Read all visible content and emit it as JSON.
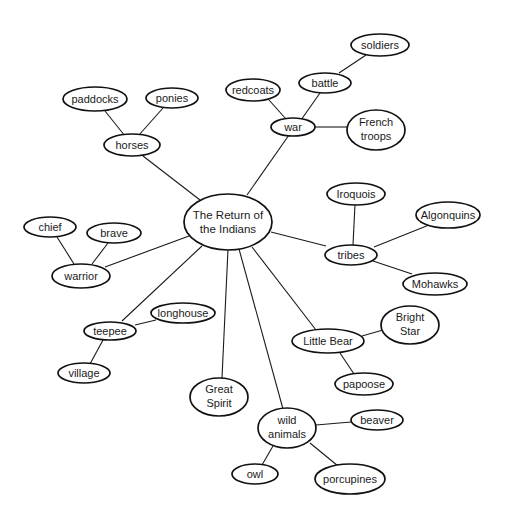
{
  "diagram": {
    "type": "concept-map",
    "center": {
      "line1": "The Return of",
      "line2": "the Indians"
    },
    "nodes": {
      "horses": "horses",
      "paddocks": "paddocks",
      "ponies": "ponies",
      "war": "war",
      "redcoats": "redcoats",
      "battle": "battle",
      "soldiers": "soldiers",
      "french_troops": {
        "line1": "French",
        "line2": "troops"
      },
      "warrior": "warrior",
      "chief": "chief",
      "brave": "brave",
      "teepee": "teepee",
      "longhouse": "longhouse",
      "village": "village",
      "great_spirit": {
        "line1": "Great",
        "line2": "Spirit"
      },
      "tribes": "tribes",
      "iroquois": "Iroquois",
      "algonquins": "Algonquins",
      "mohawks": "Mohawks",
      "little_bear": "Little Bear",
      "bright_star": {
        "line1": "Bright",
        "line2": "Star"
      },
      "papoose": "papoose",
      "wild_animals": {
        "line1": "wild",
        "line2": "animals"
      },
      "beaver": "beaver",
      "owl": "owl",
      "porcupines": "porcupines"
    },
    "edges": [
      [
        "The Return of the Indians",
        "horses"
      ],
      [
        "horses",
        "paddocks"
      ],
      [
        "horses",
        "ponies"
      ],
      [
        "The Return of the Indians",
        "war"
      ],
      [
        "war",
        "redcoats"
      ],
      [
        "war",
        "battle"
      ],
      [
        "battle",
        "soldiers"
      ],
      [
        "war",
        "French troops"
      ],
      [
        "The Return of the Indians",
        "warrior"
      ],
      [
        "warrior",
        "chief"
      ],
      [
        "warrior",
        "brave"
      ],
      [
        "The Return of the Indians",
        "teepee"
      ],
      [
        "teepee",
        "longhouse"
      ],
      [
        "teepee",
        "village"
      ],
      [
        "The Return of the Indians",
        "Great Spirit"
      ],
      [
        "The Return of the Indians",
        "tribes"
      ],
      [
        "tribes",
        "Iroquois"
      ],
      [
        "tribes",
        "Algonquins"
      ],
      [
        "tribes",
        "Mohawks"
      ],
      [
        "The Return of the Indians",
        "Little Bear"
      ],
      [
        "Little Bear",
        "Bright Star"
      ],
      [
        "Little Bear",
        "papoose"
      ],
      [
        "The Return of the Indians",
        "wild animals"
      ],
      [
        "wild animals",
        "beaver"
      ],
      [
        "wild animals",
        "owl"
      ],
      [
        "wild animals",
        "porcupines"
      ]
    ],
    "colors": {
      "stroke": "#111111",
      "fill": "#ffffff",
      "text": "#1a1a1a"
    }
  }
}
